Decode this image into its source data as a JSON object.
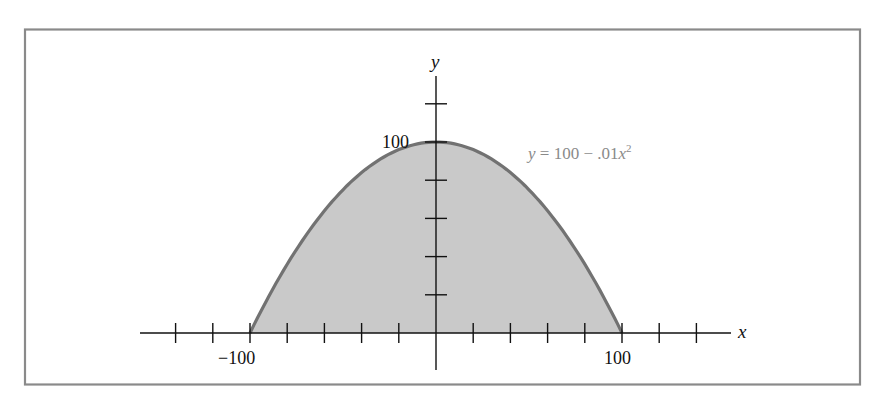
{
  "chart_data": {
    "type": "area",
    "title": "",
    "function": "y = 100 - .01x^2",
    "xlabel": "x",
    "ylabel": "y",
    "xlim": [
      -140,
      160
    ],
    "ylim": [
      0,
      120
    ],
    "x_ticks": [
      -140,
      -120,
      -100,
      -80,
      -60,
      -40,
      -20,
      20,
      40,
      60,
      80,
      100,
      120,
      140
    ],
    "y_ticks": [
      20,
      40,
      60,
      80,
      100,
      120
    ],
    "x_tick_labels": [
      {
        "value": -100,
        "text": "−100"
      },
      {
        "value": 100,
        "text": "100"
      }
    ],
    "y_tick_labels": [
      {
        "value": 100,
        "text": "100"
      }
    ],
    "x": [
      -100,
      -80,
      -60,
      -40,
      -20,
      0,
      20,
      40,
      60,
      80,
      100
    ],
    "values": [
      0,
      36,
      64,
      84,
      96,
      100,
      96,
      84,
      64,
      36,
      0
    ],
    "grid": false,
    "legend": null,
    "annotations": [
      {
        "text": "y = 100 − .01x²",
        "near": [
          60,
          95
        ]
      }
    ]
  },
  "labels": {
    "x_axis": "x",
    "y_axis": "y",
    "x_neg": "−100",
    "x_pos": "100",
    "y_100": "100",
    "eq_y": "y",
    "eq_mid": " = 100 − .01",
    "eq_x": "x",
    "eq_exp": "2"
  },
  "colors": {
    "frame": "#8a8a8a",
    "fill": "#c9c9c9",
    "curve": "#727272",
    "axis": "#111111"
  }
}
